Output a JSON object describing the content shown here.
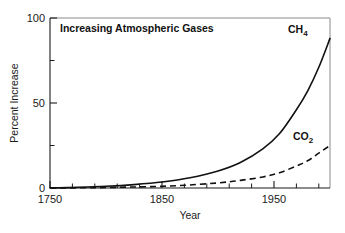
{
  "chart_data": {
    "type": "line",
    "title": "Increasing Atmospheric Gases",
    "xlabel": "Year",
    "ylabel": "Percent Increase",
    "xlim": [
      1750,
      2000
    ],
    "ylim": [
      0,
      100
    ],
    "grid": false,
    "legend_position": "inline-end-of-curve",
    "x_ticks_major": [
      1750,
      1850,
      1950
    ],
    "x_ticklabels": [
      "1750",
      "1850",
      "1950"
    ],
    "x_ticks_minor": [
      1770,
      1790,
      1810,
      1830,
      1870,
      1890,
      1910,
      1930,
      1970,
      1990
    ],
    "y_ticks_major": [
      0,
      50,
      100
    ],
    "y_ticklabels": [
      "0",
      "50",
      "100"
    ],
    "y_ticks_minor": [
      25,
      75
    ],
    "series": [
      {
        "name": "CH4",
        "label_html": "CH<sub>4</sub>",
        "style": "solid",
        "color": "#111111",
        "x": [
          1750,
          1775,
          1800,
          1825,
          1850,
          1875,
          1900,
          1920,
          1940,
          1955,
          1970,
          1980,
          1990,
          2000
        ],
        "values": [
          0,
          0.4,
          1.0,
          2.0,
          3.5,
          6.0,
          10.0,
          15.0,
          23.0,
          32.0,
          46.0,
          57.0,
          71.0,
          88.0
        ]
      },
      {
        "name": "CO2",
        "label_html": "CO<sub>2</sub>",
        "style": "dashed",
        "color": "#111111",
        "x": [
          1750,
          1775,
          1800,
          1825,
          1850,
          1875,
          1900,
          1920,
          1940,
          1955,
          1970,
          1980,
          1990,
          2000
        ],
        "values": [
          0,
          0.1,
          0.3,
          0.6,
          1.0,
          1.8,
          3.0,
          4.5,
          6.5,
          9.0,
          13.0,
          16.0,
          20.5,
          25.0
        ]
      }
    ],
    "annotations": [
      {
        "text": "CH4",
        "x": 1968,
        "y": 94
      },
      {
        "text": "CO2",
        "x": 1962,
        "y": 34
      }
    ]
  }
}
